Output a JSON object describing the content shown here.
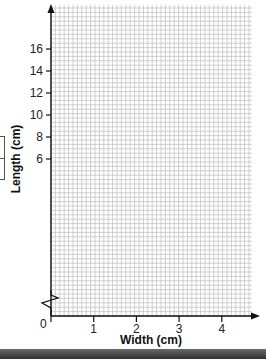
{
  "chart_data": {
    "type": "line",
    "title": "",
    "xlabel": "Width (cm)",
    "ylabel": "Length (cm)",
    "x_ticks": [
      "0",
      "1",
      "2",
      "3",
      "4"
    ],
    "y_ticks": [
      "6",
      "8",
      "10",
      "12",
      "14",
      "16"
    ],
    "xlim": [
      0,
      4.8
    ],
    "ylim": [
      4,
      17.5
    ],
    "y_axis_break": true,
    "grid": true,
    "grid_minor_per_unit_x": 10,
    "grid_minor_per_unit_y": 5,
    "series": [],
    "legend": null
  },
  "axes": {
    "x_title": "Width (cm)",
    "y_title": "Length (cm)",
    "origin_label": "0",
    "x_labels": [
      "1",
      "2",
      "3",
      "4"
    ],
    "y_labels": [
      "6",
      "8",
      "10",
      "12",
      "14",
      "16"
    ]
  },
  "colors": {
    "grid": "#bdbdbd",
    "axis": "#111111",
    "bar": "#3a3a3a"
  }
}
